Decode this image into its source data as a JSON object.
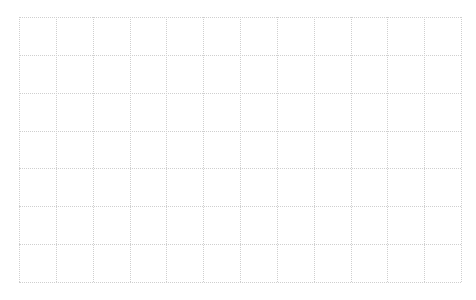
{
  "grid": {
    "left": 19,
    "top": 17,
    "right": 461,
    "bottom": 282,
    "columns": 12,
    "rows": 7,
    "line_color": "#cfcfcf",
    "line_style": "dotted",
    "background": "#ffffff"
  }
}
